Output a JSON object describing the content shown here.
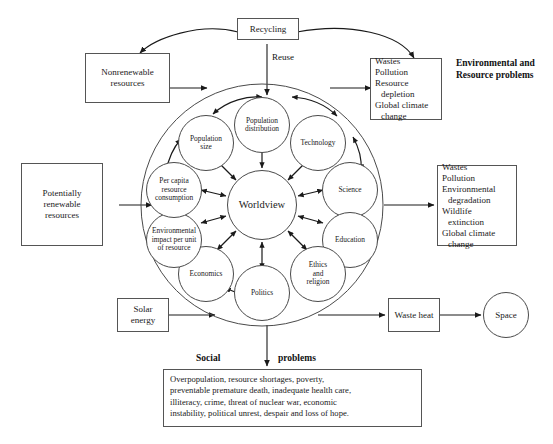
{
  "figure": {
    "title_right": "Environmental and\nResource problems",
    "title_right_line1": "Environmental and",
    "title_right_line2": "Resource problems",
    "social_label_left": "Social",
    "social_label_right": "problems"
  },
  "boxes": {
    "recycling": {
      "label": "Recycling"
    },
    "nonrenewable": {
      "line1": "Nonrenewable",
      "line2": "resources"
    },
    "potentially_renewable": {
      "line1": "Potentially",
      "line2": "renewable",
      "line3": "resources"
    },
    "solar_energy": {
      "line1": "Solar",
      "line2": "energy"
    },
    "waste_heat": {
      "line1": "Waste",
      "line2": "heat"
    },
    "space": {
      "label": "Space"
    },
    "env_problems_top": {
      "lines": [
        {
          "text": "Wastes",
          "indent": false
        },
        {
          "text": "Pollution",
          "indent": false
        },
        {
          "text": "Resource",
          "indent": false
        },
        {
          "text": "depletion",
          "indent": true
        },
        {
          "text": "Global climate",
          "indent": false
        },
        {
          "text": "change",
          "indent": true
        }
      ]
    },
    "env_problems_right": {
      "lines": [
        {
          "text": "Wastes",
          "indent": false
        },
        {
          "text": "Pollution",
          "indent": false
        },
        {
          "text": "Environmental",
          "indent": false
        },
        {
          "text": "degradation",
          "indent": true
        },
        {
          "text": "Wildlife",
          "indent": false
        },
        {
          "text": "extinction",
          "indent": true
        },
        {
          "text": "Global climate",
          "indent": false
        },
        {
          "text": "change",
          "indent": true
        }
      ]
    },
    "social_problems": {
      "lines": [
        "Overpopulation, resource shortages, poverty,",
        "preventable premature death, inadequate health care,",
        "illiteracy, crime, threat of nuclear war, economic",
        "instability, political unrest, despair and loss of hope."
      ]
    }
  },
  "arrow_labels": {
    "reuse": "Reuse"
  },
  "wheel": {
    "center": {
      "label": "Worldview"
    },
    "nodes": [
      {
        "id": "population-distribution",
        "label": "Population\ndistribution",
        "line1": "Population",
        "line2": "distribution"
      },
      {
        "id": "technology",
        "label": "Technology",
        "line1": "Technology",
        "line2": ""
      },
      {
        "id": "science",
        "label": "Science",
        "line1": "Science",
        "line2": ""
      },
      {
        "id": "education",
        "label": "Education",
        "line1": "Education",
        "line2": ""
      },
      {
        "id": "ethics-and-religion",
        "label": "Ethics and religion",
        "line1": "Ethics",
        "line2": "and",
        "line3": "religion"
      },
      {
        "id": "politics",
        "label": "Politics",
        "line1": "Politics",
        "line2": ""
      },
      {
        "id": "economics",
        "label": "Economics",
        "line1": "Economics",
        "line2": ""
      },
      {
        "id": "environmental-impact-per-unit-of-resource",
        "label": "Environmental impact per unit of resource",
        "line1": "Environmental",
        "line2": "impact per unit",
        "line3": "of resource"
      },
      {
        "id": "per-capita-resource-consumption",
        "label": "Per capita resource consumption",
        "line1": "Per capita",
        "line2": "resource",
        "line3": "consumption"
      },
      {
        "id": "population-size",
        "label": "Population size",
        "line1": "Population",
        "line2": "size",
        "line3": ""
      }
    ]
  },
  "colors": {
    "stroke": "#4a4a4a",
    "box_stroke": "#555555",
    "text": "#1a1a1a",
    "background": "#ffffff"
  }
}
